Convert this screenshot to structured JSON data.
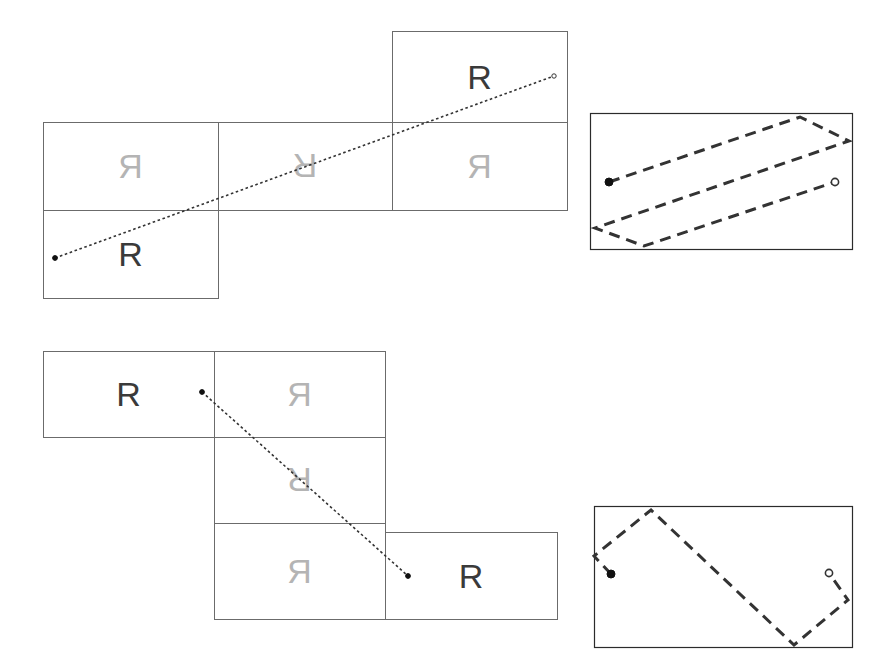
{
  "figure": {
    "title": "",
    "background_color": "#ffffff",
    "width": 886,
    "height": 660,
    "glyph_letter": "R",
    "colors": {
      "dark_glyph": "#3a3a3a",
      "light_glyph": "#b4b4b4",
      "box_stroke": "#6b6b6b",
      "panel_stroke": "#2b2b2b",
      "path_stroke": "#333333",
      "start_marker_fill": "#111111",
      "end_marker_fill": "#ffffff",
      "end_marker_stroke": "#333333"
    }
  },
  "panels": [
    {
      "id": "top-unfolding",
      "name": "top-left-unfolded-net",
      "description": "Unfolded net of squares containing the letter R in various orientations, with a dotted straight line crossing it",
      "cells": [
        {
          "id": "tl-a",
          "x": 43,
          "y": 122,
          "w": 175,
          "h": 88,
          "letter": "R",
          "orientation": "mirrored",
          "shade": "light"
        },
        {
          "id": "tl-b",
          "x": 43,
          "y": 210,
          "w": 175,
          "h": 88,
          "letter": "R",
          "orientation": "upright",
          "shade": "dark"
        },
        {
          "id": "tl-c",
          "x": 218,
          "y": 122,
          "w": 174,
          "h": 88,
          "letter": "R",
          "orientation": "rotated-180",
          "shade": "light"
        },
        {
          "id": "tl-d",
          "x": 392,
          "y": 122,
          "w": 175,
          "h": 88,
          "letter": "R",
          "orientation": "mirrored",
          "shade": "light"
        },
        {
          "id": "tl-e",
          "x": 392,
          "y": 31,
          "w": 175,
          "h": 91,
          "letter": "R",
          "orientation": "upright",
          "shade": "dark"
        }
      ],
      "path": {
        "kind": "dotted-line",
        "start": {
          "x": 55,
          "y": 258,
          "marker": "filled-dot"
        },
        "end": {
          "x": 554,
          "y": 76,
          "marker": "open-circle"
        }
      }
    },
    {
      "id": "top-right-folded",
      "name": "top-right-folded-path",
      "description": "Dashed zigzag path inside a rectangle, start filled dot on left, end open circle on right",
      "frame": {
        "x": 590,
        "y": 113,
        "w": 262,
        "h": 136
      },
      "path": {
        "kind": "dashed-polyline",
        "points": [
          {
            "x": 609,
            "y": 182
          },
          {
            "x": 800,
            "y": 117
          },
          {
            "x": 849,
            "y": 141
          },
          {
            "x": 595,
            "y": 228
          },
          {
            "x": 644,
            "y": 246
          },
          {
            "x": 835,
            "y": 182
          }
        ],
        "start_marker": "filled-dot",
        "end_marker": "open-circle"
      }
    },
    {
      "id": "bottom-unfolding",
      "name": "bottom-left-unfolded-net",
      "description": "Unfolded net of squares containing the letter R in various orientations, with a dotted straight line crossing it",
      "cells": [
        {
          "id": "bl-a",
          "x": 43,
          "y": 351,
          "w": 171,
          "h": 86,
          "letter": "R",
          "orientation": "upright",
          "shade": "dark"
        },
        {
          "id": "bl-b",
          "x": 214,
          "y": 351,
          "w": 171,
          "h": 86,
          "letter": "R",
          "orientation": "mirrored",
          "shade": "light"
        },
        {
          "id": "bl-c",
          "x": 214,
          "y": 437,
          "w": 171,
          "h": 86,
          "letter": "R",
          "orientation": "rotated-180",
          "shade": "light"
        },
        {
          "id": "bl-d",
          "x": 214,
          "y": 523,
          "w": 171,
          "h": 96,
          "letter": "R",
          "orientation": "mirrored",
          "shade": "light"
        },
        {
          "id": "bl-e",
          "x": 385,
          "y": 532,
          "w": 172,
          "h": 87,
          "letter": "R",
          "orientation": "upright",
          "shade": "dark"
        }
      ],
      "path": {
        "kind": "dotted-line",
        "start": {
          "x": 202,
          "y": 392,
          "marker": "filled-dot"
        },
        "end": {
          "x": 408,
          "y": 576,
          "marker": "filled-dot"
        }
      }
    },
    {
      "id": "bottom-right-folded",
      "name": "bottom-right-folded-path",
      "description": "Dashed zigzag path inside a rectangle, start filled dot on left, end open circle on right",
      "frame": {
        "x": 594,
        "y": 506,
        "w": 258,
        "h": 141
      },
      "path": {
        "kind": "dashed-polyline",
        "points": [
          {
            "x": 611,
            "y": 574
          },
          {
            "x": 594,
            "y": 556
          },
          {
            "x": 651,
            "y": 510
          },
          {
            "x": 794,
            "y": 645
          },
          {
            "x": 848,
            "y": 600
          },
          {
            "x": 829,
            "y": 573
          }
        ],
        "start_marker": "filled-dot",
        "end_marker": "open-circle"
      }
    }
  ]
}
